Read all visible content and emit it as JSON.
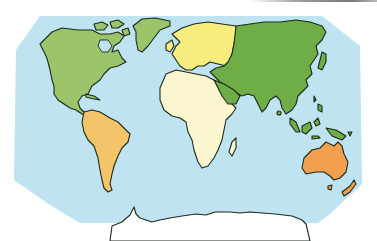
{
  "map": {
    "type": "world-continents",
    "colors": {
      "ocean": "#bfe3f0",
      "north_america": "#9cc46a",
      "south_america": "#f4c46a",
      "europe": "#f7ec7e",
      "africa": "#fbf6cf",
      "asia": "#6fae46",
      "australia": "#f2a04e",
      "antarctica": "#ffffff",
      "greenland": "#9cc46a",
      "new_zealand": "#f2a04e"
    },
    "regions": [
      {
        "name": "North America"
      },
      {
        "name": "South America"
      },
      {
        "name": "Europe"
      },
      {
        "name": "Africa"
      },
      {
        "name": "Asia"
      },
      {
        "name": "Australia"
      },
      {
        "name": "Antarctica"
      }
    ]
  }
}
